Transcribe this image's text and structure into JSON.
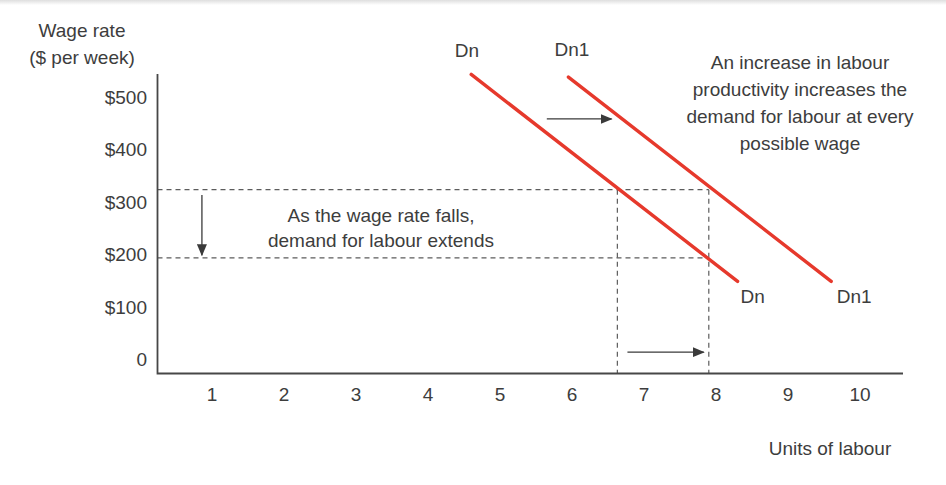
{
  "figure": {
    "y_axis_title_lines": [
      "Wage rate",
      "($ per week)"
    ],
    "x_axis_title": "Units of labour",
    "annotation_wage_fall_lines": [
      "As the wage rate falls,",
      "demand for labour extends"
    ],
    "annotation_productivity_lines": [
      "An increase in labour",
      "productivity increases the",
      "demand for labour at every",
      "possible wage"
    ]
  },
  "chart_data": {
    "type": "line",
    "xlabel": "Units of labour",
    "ylabel": "Wage rate ($ per week)",
    "xlim": [
      0,
      10.6
    ],
    "ylim": [
      0,
      600
    ],
    "grid": false,
    "legend_position": "none",
    "x_ticks": [
      1,
      2,
      3,
      4,
      5,
      6,
      7,
      8,
      9,
      10
    ],
    "y_ticks": [
      {
        "value": 500,
        "label": "$500"
      },
      {
        "value": 400,
        "label": "$400"
      },
      {
        "value": 300,
        "label": "$300"
      },
      {
        "value": 200,
        "label": "$200"
      },
      {
        "value": 100,
        "label": "$100"
      },
      {
        "value": 0,
        "label": "0"
      }
    ],
    "colors": {
      "curve": "#e6392c",
      "axis": "#474747",
      "dash": "#5c5c5c",
      "arrow": "#3a3a3a",
      "text": "#3d3d3d"
    },
    "series": [
      {
        "name": "Dn",
        "points": [
          [
            4.6,
            545
          ],
          [
            8.3,
            150
          ]
        ],
        "labels": [
          {
            "text": "Dn",
            "x": 4.54,
            "y": 590,
            "pos": "top"
          },
          {
            "text": "Dn",
            "x": 8.51,
            "y": 120,
            "pos": "bottom"
          }
        ]
      },
      {
        "name": "Dn1",
        "points": [
          [
            5.95,
            540
          ],
          [
            9.6,
            150
          ]
        ],
        "labels": [
          {
            "text": "Dn1",
            "x": 6.0,
            "y": 592,
            "pos": "top"
          },
          {
            "text": "Dn1",
            "x": 9.92,
            "y": 120,
            "pos": "bottom"
          }
        ]
      }
    ],
    "guide_lines": [
      {
        "name": "wage-high-guide",
        "type": "h",
        "value": 325,
        "to": 7.9
      },
      {
        "name": "wage-low-guide",
        "type": "h",
        "value": 195,
        "to": 7.9
      },
      {
        "name": "qty-dn-guide",
        "type": "v",
        "value": 6.63,
        "from": 325
      },
      {
        "name": "qty-dn1-guide",
        "type": "v",
        "value": 7.9,
        "from": 325
      }
    ],
    "arrows": [
      {
        "name": "demand-shift-arrow",
        "x1": 5.65,
        "y1": 460,
        "x2": 6.55,
        "y2": 460
      },
      {
        "name": "wage-fall-arrow",
        "x1": 0.86,
        "y1": 315,
        "x2": 0.86,
        "y2": 200
      },
      {
        "name": "quantity-extend-arrow",
        "x1": 6.77,
        "y1": 15,
        "x2": 7.83,
        "y2": 15
      }
    ]
  }
}
